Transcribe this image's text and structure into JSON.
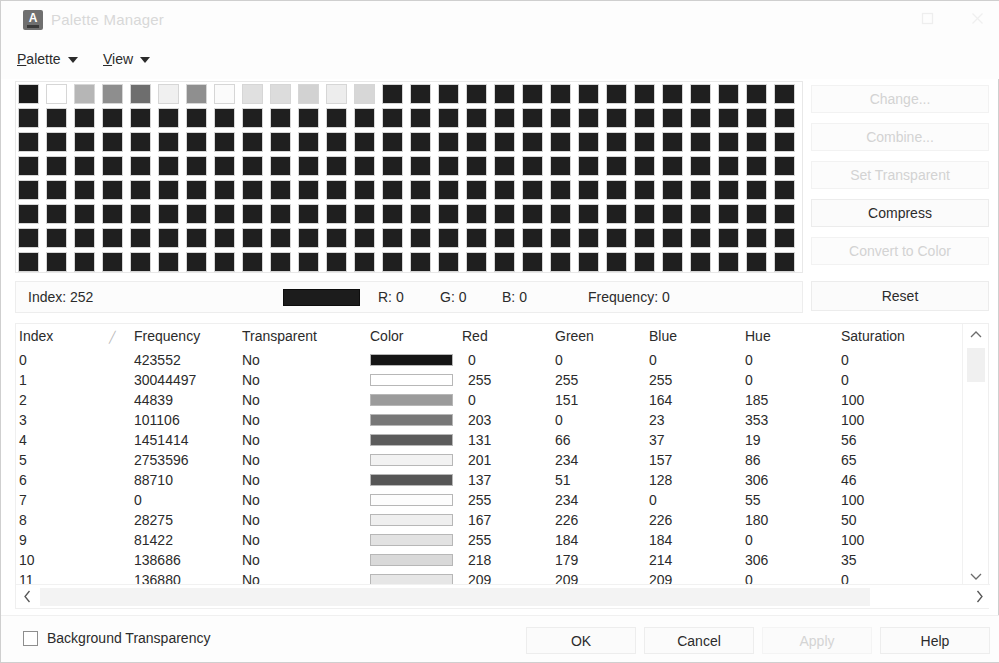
{
  "window": {
    "title": "Palette Manager",
    "app_icon": "autocad-a-icon",
    "maximize_icon": "maximize-icon",
    "close_icon": "close-icon"
  },
  "menubar": {
    "palette": {
      "label": "Palette",
      "mnemonic": "P"
    },
    "view": {
      "label": "View",
      "mnemonic": "V"
    }
  },
  "sort": {
    "label": "Sort by:",
    "value": "Index",
    "options": [
      "Index",
      "Frequency",
      "Red",
      "Green",
      "Blue",
      "Hue",
      "Saturation"
    ],
    "chevron_icon": "chevron-down-icon"
  },
  "select_color": {
    "label": "Select Color",
    "mnemonic": "S",
    "icon": "eyedropper-cursor-icon"
  },
  "side_buttons": [
    {
      "label": "Change...",
      "name": "change-button",
      "enabled": false
    },
    {
      "label": "Combine...",
      "name": "combine-button",
      "enabled": false
    },
    {
      "label": "Set Transparent",
      "name": "set-transparent-button",
      "enabled": false
    },
    {
      "label": "Compress",
      "name": "compress-button",
      "enabled": true
    },
    {
      "label": "Convert to Color",
      "name": "convert-to-color-button",
      "enabled": false
    }
  ],
  "reset_button": {
    "label": "Reset",
    "enabled": true
  },
  "info_bar": {
    "index_label": "Index:",
    "index_value": "252",
    "swatch_color": "#1c1c1c",
    "r_label": "R:",
    "r_value": "0",
    "g_label": "G:",
    "g_value": "0",
    "b_label": "B:",
    "b_value": "0",
    "frequency_label": "Frequency:",
    "frequency_value": "0"
  },
  "table": {
    "columns": [
      "Index",
      "Frequency",
      "Transparent",
      "Color",
      "Red",
      "Green",
      "Blue",
      "Hue",
      "Saturation"
    ],
    "sort_indicator": "╱",
    "rows": [
      {
        "index": "0",
        "frequency": "423552",
        "transparent": "No",
        "color": "#151515",
        "red": "0",
        "green": "0",
        "blue": "0",
        "hue": "0",
        "saturation": "0"
      },
      {
        "index": "1",
        "frequency": "30044497",
        "transparent": "No",
        "color": "#ffffff",
        "red": "255",
        "green": "255",
        "blue": "255",
        "hue": "0",
        "saturation": "0"
      },
      {
        "index": "2",
        "frequency": "44839",
        "transparent": "No",
        "color": "#9b9b9b",
        "red": "0",
        "green": "151",
        "blue": "164",
        "hue": "185",
        "saturation": "100"
      },
      {
        "index": "3",
        "frequency": "101106",
        "transparent": "No",
        "color": "#777777",
        "red": "203",
        "green": "0",
        "blue": "23",
        "hue": "353",
        "saturation": "100"
      },
      {
        "index": "4",
        "frequency": "1451414",
        "transparent": "No",
        "color": "#5c5c5c",
        "red": "131",
        "green": "66",
        "blue": "37",
        "hue": "19",
        "saturation": "56"
      },
      {
        "index": "5",
        "frequency": "2753596",
        "transparent": "No",
        "color": "#f2f2f2",
        "red": "201",
        "green": "234",
        "blue": "157",
        "hue": "86",
        "saturation": "65"
      },
      {
        "index": "6",
        "frequency": "88710",
        "transparent": "No",
        "color": "#565656",
        "red": "137",
        "green": "51",
        "blue": "128",
        "hue": "306",
        "saturation": "46"
      },
      {
        "index": "7",
        "frequency": "0",
        "transparent": "No",
        "color": "#fdfdfd",
        "red": "255",
        "green": "234",
        "blue": "0",
        "hue": "55",
        "saturation": "100"
      },
      {
        "index": "8",
        "frequency": "28275",
        "transparent": "No",
        "color": "#efefef",
        "red": "167",
        "green": "226",
        "blue": "226",
        "hue": "180",
        "saturation": "50"
      },
      {
        "index": "9",
        "frequency": "81422",
        "transparent": "No",
        "color": "#e2e2e2",
        "red": "255",
        "green": "184",
        "blue": "184",
        "hue": "0",
        "saturation": "100"
      },
      {
        "index": "10",
        "frequency": "138686",
        "transparent": "No",
        "color": "#d9d9d9",
        "red": "218",
        "green": "179",
        "blue": "214",
        "hue": "306",
        "saturation": "35"
      },
      {
        "index": "11",
        "frequency": "136880",
        "transparent": "No",
        "color": "#e6e6e6",
        "red": "209",
        "green": "209",
        "blue": "209",
        "hue": "0",
        "saturation": "0"
      },
      {
        "index": "12",
        "frequency": "999375",
        "transparent": "No",
        "color": "#8a8a8a",
        "red": "207",
        "green": "164",
        "blue": "119",
        "hue": "30",
        "saturation": "48"
      }
    ]
  },
  "scrollbars": {
    "v_up_icon": "chevron-up-icon",
    "v_down_icon": "chevron-down-icon",
    "h_left_icon": "chevron-left-icon",
    "h_right_icon": "chevron-right-icon"
  },
  "footer": {
    "background_transparency": {
      "label": "Background Transparency",
      "checked": false
    },
    "buttons": [
      {
        "label": "OK",
        "name": "ok-button",
        "enabled": true
      },
      {
        "label": "Cancel",
        "name": "cancel-button",
        "enabled": true
      },
      {
        "label": "Apply",
        "name": "apply-button",
        "enabled": false
      },
      {
        "label": "Help",
        "name": "help-button",
        "enabled": true
      }
    ]
  },
  "color_grid": {
    "columns": 28,
    "rows": 8,
    "selected_index": 252,
    "swatches": [
      "#1b1b1b",
      "#ffffff",
      "#b6b6b6",
      "#8e8e8e",
      "#6e6e6e",
      "#f0f0f0",
      "#8f8f8f",
      "#fbfbfb",
      "#e0e0e0",
      "#dcdcdc",
      "#d2d2d2",
      "#ededed",
      "#d7d7d7",
      "#1f1f1f",
      "#1f1f1f",
      "#1f1f1f",
      "#1f1f1f",
      "#1f1f1f",
      "#1f1f1f",
      "#1f1f1f",
      "#1f1f1f",
      "#1f1f1f",
      "#1f1f1f",
      "#1f1f1f",
      "#1f1f1f",
      "#1f1f1f",
      "#1f1f1f",
      "#1f1f1f",
      "#1f1f1f",
      "#1f1f1f",
      "#1f1f1f",
      "#1f1f1f",
      "#1f1f1f",
      "#1f1f1f",
      "#1f1f1f",
      "#1f1f1f",
      "#1f1f1f",
      "#1f1f1f",
      "#1f1f1f",
      "#1f1f1f",
      "#1f1f1f",
      "#1f1f1f",
      "#1f1f1f",
      "#1f1f1f",
      "#1f1f1f",
      "#1f1f1f",
      "#1f1f1f",
      "#1f1f1f",
      "#1f1f1f",
      "#1f1f1f",
      "#1f1f1f",
      "#1f1f1f",
      "#1f1f1f",
      "#1f1f1f",
      "#1f1f1f",
      "#1f1f1f",
      "#1f1f1f",
      "#1f1f1f",
      "#1f1f1f",
      "#1f1f1f",
      "#1f1f1f",
      "#1f1f1f",
      "#1f1f1f",
      "#1f1f1f",
      "#1f1f1f",
      "#1f1f1f",
      "#1f1f1f",
      "#1f1f1f",
      "#1f1f1f",
      "#1f1f1f",
      "#1f1f1f",
      "#1f1f1f",
      "#1f1f1f",
      "#1f1f1f",
      "#1f1f1f",
      "#1f1f1f",
      "#1f1f1f",
      "#1f1f1f",
      "#1f1f1f",
      "#1f1f1f",
      "#1f1f1f",
      "#1f1f1f",
      "#1f1f1f",
      "#1f1f1f",
      "#1f1f1f",
      "#1f1f1f",
      "#1f1f1f",
      "#1f1f1f",
      "#1f1f1f",
      "#1f1f1f",
      "#1f1f1f",
      "#1f1f1f",
      "#1f1f1f",
      "#1f1f1f",
      "#1f1f1f",
      "#1f1f1f",
      "#1f1f1f",
      "#1f1f1f",
      "#1f1f1f",
      "#1f1f1f",
      "#1f1f1f",
      "#1f1f1f",
      "#1f1f1f",
      "#1f1f1f",
      "#1f1f1f",
      "#1f1f1f",
      "#1f1f1f",
      "#1f1f1f",
      "#1f1f1f",
      "#1f1f1f",
      "#1f1f1f",
      "#1f1f1f",
      "#1f1f1f",
      "#1f1f1f",
      "#1f1f1f",
      "#1f1f1f",
      "#1f1f1f",
      "#1f1f1f",
      "#1f1f1f",
      "#1f1f1f",
      "#1f1f1f",
      "#1f1f1f",
      "#1f1f1f",
      "#1f1f1f",
      "#1f1f1f",
      "#1f1f1f",
      "#1f1f1f",
      "#1f1f1f",
      "#1f1f1f",
      "#1f1f1f",
      "#1f1f1f",
      "#1f1f1f",
      "#1f1f1f",
      "#1f1f1f",
      "#1f1f1f",
      "#1f1f1f",
      "#1f1f1f",
      "#1f1f1f",
      "#1f1f1f",
      "#1f1f1f",
      "#1f1f1f",
      "#1f1f1f",
      "#1f1f1f",
      "#1f1f1f",
      "#1f1f1f",
      "#1f1f1f",
      "#1f1f1f",
      "#1f1f1f",
      "#1f1f1f",
      "#1f1f1f",
      "#1f1f1f",
      "#1f1f1f",
      "#1f1f1f",
      "#1f1f1f",
      "#1f1f1f",
      "#1f1f1f",
      "#1f1f1f",
      "#1f1f1f",
      "#1f1f1f",
      "#1f1f1f",
      "#1f1f1f",
      "#1f1f1f",
      "#1f1f1f",
      "#1f1f1f",
      "#1f1f1f",
      "#1f1f1f",
      "#1f1f1f",
      "#1f1f1f",
      "#1f1f1f",
      "#1f1f1f",
      "#1f1f1f",
      "#1f1f1f",
      "#1f1f1f",
      "#1f1f1f",
      "#1f1f1f",
      "#1f1f1f",
      "#1f1f1f",
      "#1f1f1f",
      "#1f1f1f",
      "#1f1f1f",
      "#1f1f1f",
      "#1f1f1f",
      "#1f1f1f",
      "#1f1f1f",
      "#1f1f1f",
      "#1f1f1f",
      "#1f1f1f",
      "#1f1f1f",
      "#1f1f1f",
      "#1f1f1f",
      "#1f1f1f",
      "#1f1f1f",
      "#1f1f1f",
      "#1f1f1f",
      "#1f1f1f",
      "#1f1f1f",
      "#1f1f1f",
      "#1f1f1f",
      "#1f1f1f",
      "#1f1f1f",
      "#1f1f1f",
      "#1f1f1f",
      "#1f1f1f",
      "#1f1f1f",
      "#1f1f1f",
      "#1f1f1f",
      "#1f1f1f",
      "#1f1f1f",
      "#1f1f1f",
      "#1f1f1f",
      "#1f1f1f",
      "#1f1f1f",
      "#1f1f1f",
      "#1f1f1f",
      "#1f1f1f",
      "#1f1f1f",
      "#1f1f1f",
      "#1f1f1f",
      "#1f1f1f",
      "#1f1f1f",
      "#1f1f1f",
      "#1f1f1f",
      "#1f1f1f",
      "#1f1f1f"
    ]
  }
}
